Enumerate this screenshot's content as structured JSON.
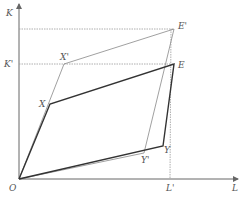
{
  "diagram": {
    "type": "edgeworth-box-shift",
    "axes": {
      "x_label": "L",
      "y_label": "K",
      "origin_label": "O"
    },
    "points": {
      "O": {
        "label": "O",
        "x": 19,
        "y": 179
      },
      "X": {
        "label": "X",
        "x": 50,
        "y": 104
      },
      "Xp": {
        "label": "X'",
        "x": 64,
        "y": 64
      },
      "E": {
        "label": "E",
        "x": 174,
        "y": 64
      },
      "Ep": {
        "label": "E'",
        "x": 174,
        "y": 29
      },
      "Y": {
        "label": "Y",
        "x": 163,
        "y": 146
      },
      "Yp": {
        "label": "Y'",
        "x": 144,
        "y": 153
      },
      "Lp": {
        "label": "L'",
        "x": 170,
        "y": 179
      }
    },
    "guide_labels": {
      "K_prime": "K'",
      "L_prime": "L'"
    },
    "colors": {
      "axis": "#666666",
      "thick_line": "#333333",
      "thin_line": "#888888",
      "dotted": "#999999",
      "text": "#555555"
    }
  }
}
